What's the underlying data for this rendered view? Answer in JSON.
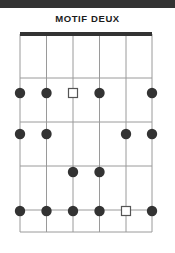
{
  "header": {
    "band_color": "#333333"
  },
  "title": {
    "text": "MOTIF DEUX"
  },
  "chart_data": {
    "type": "diagram",
    "title": "MOTIF DEUX",
    "subtype": "fretboard-chord-diagram",
    "orientation": "vertical",
    "strings": 6,
    "frets": 4,
    "string_x": [
      20,
      46.5,
      73,
      99.5,
      126,
      152
    ],
    "fret_y": [
      34,
      78,
      122,
      166,
      210,
      232
    ],
    "nut": {
      "present": true,
      "color": "#333333",
      "thickness": 4,
      "y": 34
    },
    "grid": {
      "line_color": "#9a9a9a",
      "line_width": 1,
      "left": 20,
      "right": 152,
      "top": 34,
      "bottom": 232
    },
    "marker_styles": {
      "dot": {
        "shape": "filled-circle",
        "color": "#333333",
        "radius": 5.2
      },
      "square": {
        "shape": "open-square",
        "stroke": "#555555",
        "fill": "#ffffff",
        "size": 9
      }
    },
    "markers": [
      {
        "row": 1,
        "y": 93,
        "string": 1,
        "x": 20,
        "type": "dot"
      },
      {
        "row": 1,
        "y": 93,
        "string": 2,
        "x": 46.5,
        "type": "dot"
      },
      {
        "row": 1,
        "y": 93,
        "string": 3,
        "x": 73,
        "type": "square"
      },
      {
        "row": 1,
        "y": 93,
        "string": 4,
        "x": 99.5,
        "type": "dot"
      },
      {
        "row": 1,
        "y": 93,
        "string": 6,
        "x": 152,
        "type": "dot"
      },
      {
        "row": 2,
        "y": 134,
        "string": 1,
        "x": 20,
        "type": "dot"
      },
      {
        "row": 2,
        "y": 134,
        "string": 2,
        "x": 46.5,
        "type": "dot"
      },
      {
        "row": 2,
        "y": 134,
        "string": 5,
        "x": 126,
        "type": "dot"
      },
      {
        "row": 2,
        "y": 134,
        "string": 6,
        "x": 152,
        "type": "dot"
      },
      {
        "row": 3,
        "y": 172,
        "string": 3,
        "x": 73,
        "type": "dot"
      },
      {
        "row": 3,
        "y": 172,
        "string": 4,
        "x": 99.5,
        "type": "dot"
      },
      {
        "row": 4,
        "y": 211,
        "string": 1,
        "x": 20,
        "type": "dot"
      },
      {
        "row": 4,
        "y": 211,
        "string": 2,
        "x": 46.5,
        "type": "dot"
      },
      {
        "row": 4,
        "y": 211,
        "string": 3,
        "x": 73,
        "type": "dot"
      },
      {
        "row": 4,
        "y": 211,
        "string": 4,
        "x": 99.5,
        "type": "dot"
      },
      {
        "row": 4,
        "y": 211,
        "string": 5,
        "x": 126,
        "type": "square"
      },
      {
        "row": 4,
        "y": 211,
        "string": 6,
        "x": 152,
        "type": "dot"
      }
    ],
    "row_summary": [
      {
        "row": 1,
        "dots_on_strings": [
          1,
          2,
          4,
          6
        ],
        "squares_on_strings": [
          3
        ]
      },
      {
        "row": 2,
        "dots_on_strings": [
          1,
          2,
          5,
          6
        ],
        "squares_on_strings": []
      },
      {
        "row": 3,
        "dots_on_strings": [
          3,
          4
        ],
        "squares_on_strings": []
      },
      {
        "row": 4,
        "dots_on_strings": [
          1,
          2,
          3,
          4,
          6
        ],
        "squares_on_strings": [
          5
        ]
      }
    ]
  }
}
